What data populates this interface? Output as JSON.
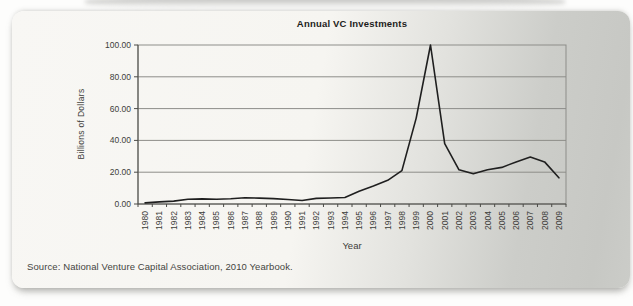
{
  "figure": {
    "source": "Source: National Venture Capital Association, 2010 Yearbook."
  },
  "chart_data": {
    "type": "line",
    "title": "Annual VC Investments",
    "xlabel": "Year",
    "ylabel": "Billions of Dollars",
    "categories": [
      "1980",
      "1981",
      "1982",
      "1983",
      "1984",
      "1985",
      "1986",
      "1987",
      "1988",
      "1989",
      "1990",
      "1991",
      "1992",
      "1993",
      "1994",
      "1995",
      "1996",
      "1997",
      "1998",
      "1999",
      "2000",
      "2001",
      "2002",
      "2003",
      "2004",
      "2005",
      "2006",
      "2007",
      "2008",
      "2009"
    ],
    "values": [
      0.7,
      1.3,
      1.8,
      3.0,
      3.2,
      3.0,
      3.3,
      3.9,
      3.7,
      3.4,
      2.8,
      2.2,
      3.5,
      3.8,
      4.1,
      8.0,
      11.3,
      14.9,
      21.0,
      54.0,
      100.0,
      38.0,
      21.5,
      19.0,
      21.5,
      23.0,
      26.5,
      29.5,
      26.5,
      16.5
    ],
    "ylim": [
      0,
      100
    ],
    "y_tick_step": 20,
    "y_tick_decimals": 2,
    "grid": true,
    "legend": false,
    "line_color": "#1f1f1f",
    "grid_color": "#8d8d89",
    "axis_color": "#4b4b47",
    "text_color": "#3d3d3a"
  }
}
